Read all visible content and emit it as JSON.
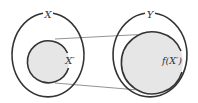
{
  "diagram": {
    "sets": {
      "domain": {
        "label": "X"
      },
      "codomain": {
        "label": "Y"
      },
      "subset": {
        "label": "X′"
      },
      "image": {
        "label": "f(X′)"
      }
    },
    "colors": {
      "stroke": "#333333",
      "fill": "#e6e6e6",
      "background": "#ffffff",
      "connector": "#666666"
    }
  }
}
